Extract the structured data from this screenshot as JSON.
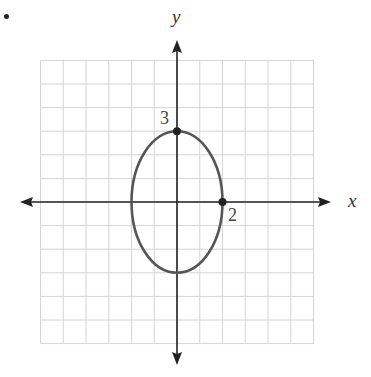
{
  "chart_data": {
    "type": "line",
    "title": "",
    "xlabel": "x",
    "ylabel": "y",
    "xlim": [
      -6,
      6
    ],
    "ylim": [
      -6,
      6
    ],
    "grid": true,
    "legend": null,
    "series": [
      {
        "name": "ellipse x^2/4 + y^2/9 = 1",
        "shape": "ellipse",
        "center": [
          0,
          0
        ],
        "semi_x": 2,
        "semi_y": 3,
        "color": "#555555"
      }
    ],
    "points": [
      {
        "x": 0,
        "y": 3,
        "label": "3"
      },
      {
        "x": 2,
        "y": 0,
        "label": "2"
      }
    ],
    "annotations": [
      "3",
      "2"
    ]
  },
  "labels": {
    "x_axis": "x",
    "y_axis": "y",
    "point_top": "3",
    "point_right": "2"
  },
  "colors": {
    "grid": "#d4d4d4",
    "axis": "#222222",
    "curve": "#555555"
  }
}
